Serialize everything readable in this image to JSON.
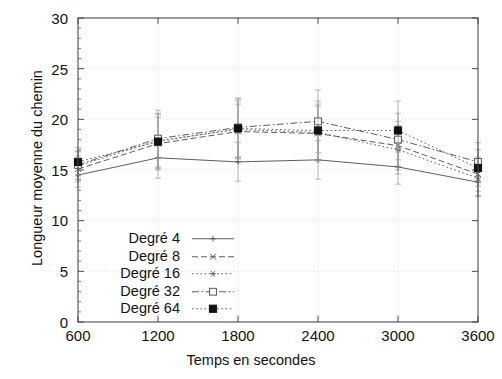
{
  "chart_data": {
    "type": "line",
    "title": "",
    "xlabel": "Temps en secondes",
    "ylabel": "Longueur moyenne du chemin",
    "x": [
      600,
      1200,
      1800,
      2400,
      3000,
      3600
    ],
    "xticklabels": [
      "600",
      "1200",
      "1800",
      "2400",
      "3000",
      "3600"
    ],
    "yticklabels": [
      "0",
      "5",
      "10",
      "15",
      "20",
      "25",
      "30"
    ],
    "yticks": [
      0,
      5,
      10,
      15,
      20,
      25,
      30
    ],
    "xlim": [
      600,
      3600
    ],
    "ylim": [
      0,
      30
    ],
    "grid": true,
    "legend_position": "lower left inside",
    "errorbars": true,
    "series": [
      {
        "name": "Degré 4",
        "style": "solid",
        "marker": "plus",
        "values": [
          14.5,
          16.2,
          15.8,
          16.0,
          15.3,
          13.8
        ],
        "err_low": [
          13.3,
          14.2,
          13.9,
          14.1,
          13.6,
          12.4
        ],
        "err_high": [
          15.6,
          18.2,
          17.7,
          17.9,
          17.0,
          15.2
        ]
      },
      {
        "name": "Degré 8",
        "style": "dashed",
        "marker": "cross",
        "values": [
          15.1,
          17.6,
          18.8,
          18.6,
          17.4,
          14.6
        ],
        "err_low": [
          13.8,
          15.0,
          16.1,
          15.9,
          15.0,
          12.9
        ],
        "err_high": [
          16.4,
          20.2,
          21.5,
          21.3,
          19.8,
          16.3
        ]
      },
      {
        "name": "Degré 16",
        "style": "dotted",
        "marker": "star",
        "values": [
          15.4,
          17.9,
          19.0,
          18.7,
          17.0,
          14.2
        ],
        "err_low": [
          14.0,
          15.2,
          16.2,
          15.9,
          14.6,
          12.5
        ],
        "err_high": [
          16.8,
          20.6,
          21.8,
          21.5,
          19.4,
          15.9
        ]
      },
      {
        "name": "Degré 32",
        "style": "dashdot",
        "marker": "open-square",
        "values": [
          15.5,
          18.1,
          19.2,
          19.8,
          18.0,
          15.8
        ],
        "err_low": [
          14.1,
          15.3,
          16.3,
          16.7,
          15.4,
          13.9
        ],
        "err_high": [
          16.9,
          20.9,
          22.1,
          22.9,
          20.6,
          17.7
        ]
      },
      {
        "name": "Degré 64",
        "style": "dotted",
        "marker": "filled-square",
        "values": [
          15.8,
          17.8,
          19.1,
          18.9,
          18.9,
          15.2
        ],
        "err_low": [
          14.4,
          15.1,
          16.2,
          16.0,
          16.0,
          13.4
        ],
        "err_high": [
          17.2,
          20.5,
          22.0,
          21.8,
          21.8,
          17.0
        ]
      }
    ]
  },
  "axes": {
    "xlabel": "Temps en secondes",
    "ylabel": "Longueur moyenne du chemin"
  },
  "xticks": {
    "t0": "600",
    "t1": "1200",
    "t2": "1800",
    "t3": "2400",
    "t4": "3000",
    "t5": "3600"
  },
  "yticks": {
    "t0": "0",
    "t1": "5",
    "t2": "10",
    "t3": "15",
    "t4": "20",
    "t5": "25",
    "t6": "30"
  },
  "legend": {
    "items": [
      {
        "label": "Degré 4"
      },
      {
        "label": "Degré 8"
      },
      {
        "label": "Degré 16"
      },
      {
        "label": "Degré 32"
      },
      {
        "label": "Degré 64"
      }
    ]
  },
  "colors": {
    "axis": "#4a4a4a",
    "grid": "#cfcfcf",
    "series": "#555555",
    "marker_fill": "#111111",
    "background": "#ffffff"
  }
}
